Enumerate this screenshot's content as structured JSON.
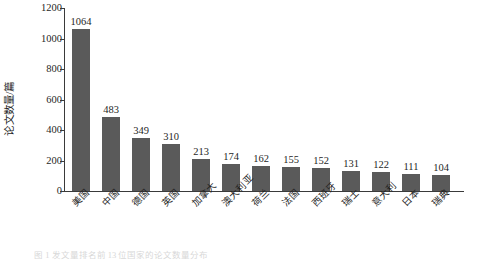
{
  "chart_data": {
    "type": "bar",
    "title": "",
    "subtitle": "",
    "xlabel": "",
    "ylabel": "论文数量/篇",
    "ylim": [
      0,
      1200
    ],
    "yticks": [
      0,
      200,
      400,
      600,
      800,
      1000,
      1200
    ],
    "grid": false,
    "legend": null,
    "bar_color": "#5a5a5a",
    "categories": [
      "美国",
      "中国",
      "德国",
      "英国",
      "加拿大",
      "澳大利亚",
      "荷兰",
      "法国",
      "西班牙",
      "瑞士",
      "意大利",
      "日本",
      "瑞典"
    ],
    "values": [
      1064,
      483,
      349,
      310,
      213,
      174,
      162,
      155,
      152,
      131,
      122,
      111,
      104
    ],
    "data_labels": [
      "1064",
      "483",
      "349",
      "310",
      "213",
      "174",
      "162",
      "155",
      "152",
      "131",
      "122",
      "111",
      "104"
    ]
  },
  "caption": {
    "text": "图 1  发文量排名前 13 位国家的论文数量分布"
  }
}
